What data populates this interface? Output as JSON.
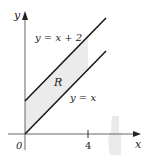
{
  "figure": {
    "axes": {
      "x_label": "x",
      "y_label": "y",
      "origin_label": "0",
      "x_tick_label": "4"
    },
    "curves": [
      {
        "name": "upper-line",
        "label": "y = x + 2",
        "equation": "y = x + 2"
      },
      {
        "name": "lower-line",
        "label": "y = x",
        "equation": "y = x"
      }
    ],
    "region": {
      "label": "R",
      "bounds": "0 ≤ x ≤ 4, x ≤ y ≤ x + 2"
    },
    "colors": {
      "line": "#1a1a1a",
      "axis": "#555555",
      "region_fill": "#e9e9e9",
      "background": "#ffffff"
    }
  }
}
